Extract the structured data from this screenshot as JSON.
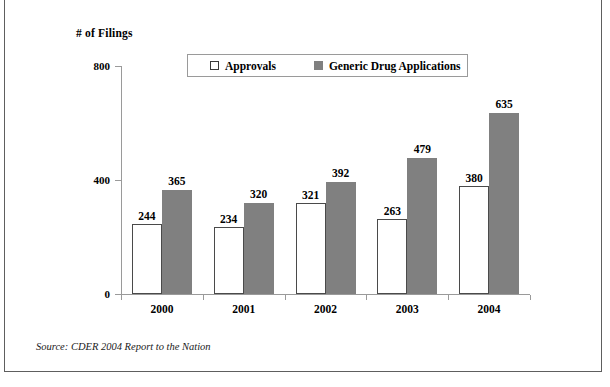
{
  "frame": {
    "axis_title": "# of Filings",
    "source_note": "Source: CDER 2004 Report to the Nation"
  },
  "legend": {
    "entries": [
      {
        "label": "Approvals",
        "swatch": "hollow-square-icon",
        "color": "#ffffff"
      },
      {
        "label": "Generic Drug Applications",
        "swatch": "filled-square-icon",
        "color": "#808080"
      }
    ]
  },
  "chart_data": {
    "type": "bar",
    "title": "",
    "xlabel": "",
    "ylabel": "# of Filings",
    "categories": [
      "2000",
      "2001",
      "2002",
      "2003",
      "2004"
    ],
    "series": [
      {
        "name": "Approvals",
        "color": "#ffffff",
        "values": [
          244,
          234,
          321,
          263,
          380
        ]
      },
      {
        "name": "Generic Drug Applications",
        "color": "#808080",
        "values": [
          365,
          320,
          392,
          479,
          635
        ]
      }
    ],
    "ylim": [
      0,
      800
    ],
    "yticks": [
      0,
      400,
      800
    ],
    "ytick_labels": [
      "0",
      "400",
      "800"
    ],
    "grid": false,
    "legend_position": "top-center",
    "data_labels": true
  }
}
